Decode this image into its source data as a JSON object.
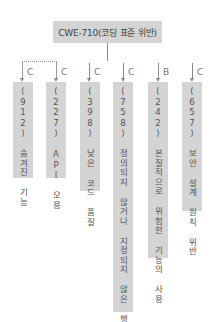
{
  "diagram": {
    "root": {
      "label": "CWE-710(코딩 표준 위반)"
    },
    "children": [
      {
        "id": "912",
        "label": "(912) 숨겨진 기능",
        "edge_label": "C"
      },
      {
        "id": "227",
        "label": "(227) API 오용",
        "edge_label": "C"
      },
      {
        "id": "398",
        "label": "(398) 낮은 코드 품질",
        "edge_label": "C"
      },
      {
        "id": "758",
        "label": "(758) 정의되지 않거나 지정되지 않은 행위에 의존",
        "edge_label": "C"
      },
      {
        "id": "242",
        "label": "(242) 본질적으로 위험한 기능의 사용",
        "edge_label": "B"
      },
      {
        "id": "657",
        "label": "(657) 보안 설계 원칙 위반",
        "edge_label": "C"
      }
    ],
    "colors": {
      "box_fill": "#d4d4d4",
      "line": "#8a8a8a",
      "text": "#555555"
    }
  }
}
